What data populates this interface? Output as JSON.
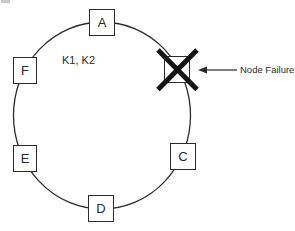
{
  "diagram": {
    "type": "ring-topology",
    "inner_label": "K1, K2",
    "annotation": {
      "label": "Node Failure",
      "arrow_icon": "arrow-left-icon",
      "points_to": "failed-node"
    },
    "nodes": [
      {
        "label": "A",
        "status": "ok",
        "position": "top"
      },
      {
        "status": "failed",
        "position": "top-right",
        "marker": "x-mark"
      },
      {
        "label": "C",
        "status": "ok",
        "position": "bottom-right"
      },
      {
        "label": "D",
        "status": "ok",
        "position": "bottom"
      },
      {
        "label": "E",
        "status": "ok",
        "position": "bottom-left"
      },
      {
        "label": "F",
        "status": "ok",
        "position": "top-left"
      }
    ],
    "colors": {
      "stroke": "#2b2b2b",
      "failure_x": "#141414",
      "background": "#ffffff"
    }
  }
}
